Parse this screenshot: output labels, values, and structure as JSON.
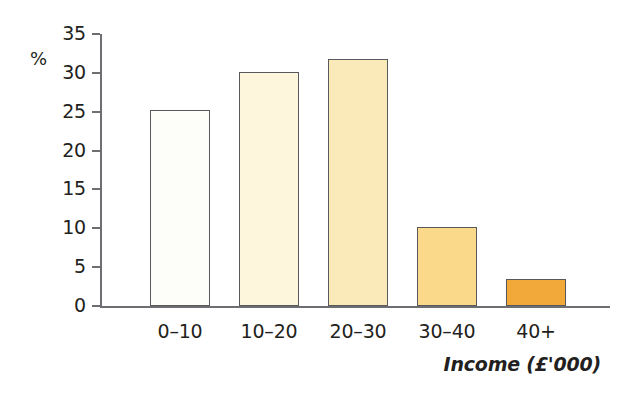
{
  "chart_data": {
    "type": "bar",
    "title": "",
    "subtitle": "",
    "categories": [
      "0–10",
      "10–20",
      "20–30",
      "30–40",
      "40+"
    ],
    "values": [
      25.2,
      30.1,
      31.8,
      10.2,
      3.5
    ],
    "series": [
      {
        "name": "Percentage of households",
        "values": [
          25.2,
          30.1,
          31.8,
          10.2,
          3.5
        ]
      }
    ],
    "xlabel": "Income (£'000)",
    "ylabel": "%",
    "ylim": [
      0,
      35
    ],
    "xlim_note": "categorical",
    "yticks": [
      0,
      5,
      10,
      15,
      20,
      25,
      30,
      35
    ],
    "ytick_labels": [
      "0",
      "5",
      "10",
      "15",
      "20",
      "25",
      "30",
      "35"
    ],
    "grid": false,
    "legend": false,
    "legend_position": "none",
    "bar_colors": [
      "#fdfdfa",
      "#fdf6dc",
      "#fbeab9",
      "#fad98b",
      "#f3a83a"
    ],
    "bar_border_color": "#58595b",
    "axis_color": "#6d6e71",
    "text_color": "#231f20",
    "background": "#ffffff",
    "annotations": []
  },
  "axis": {
    "y_label": "%",
    "x_title": "Income (£'000)"
  }
}
